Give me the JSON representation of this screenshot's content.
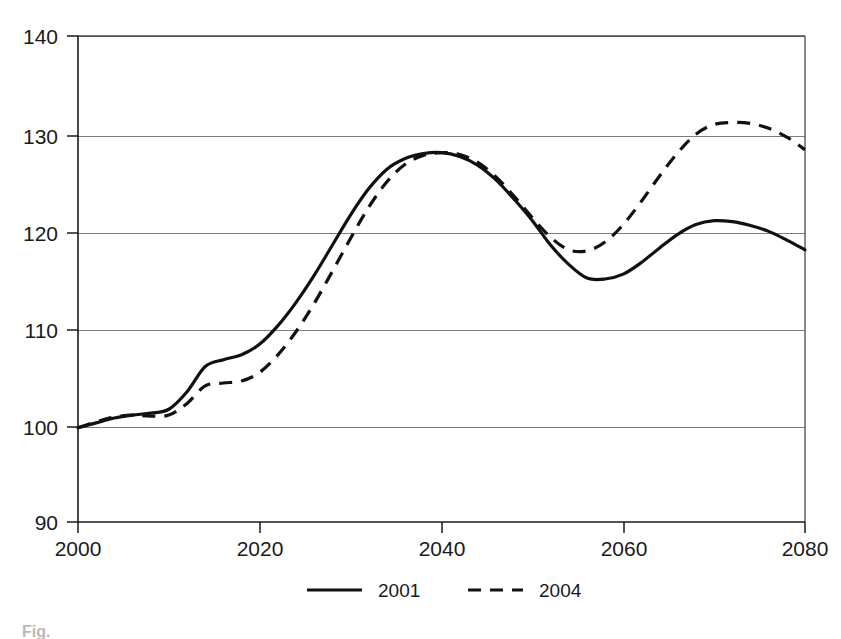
{
  "chart_data": {
    "type": "line",
    "title": "",
    "subtitle": "",
    "xlabel": "",
    "ylabel": "",
    "xlim": [
      2000,
      2080
    ],
    "ylim": [
      90,
      140
    ],
    "grid": true,
    "grid_axis": "y",
    "legend_position": "bottom-center",
    "x_ticks": [
      2000,
      2020,
      2040,
      2060,
      2080
    ],
    "x_tick_labels": [
      "2000",
      "2020",
      "2040",
      "2060",
      "2080"
    ],
    "y_ticks": [
      90,
      100,
      110,
      120,
      130,
      140
    ],
    "y_tick_labels": [
      "90",
      "100",
      "110",
      "120",
      "130",
      "140"
    ],
    "x": [
      2000,
      2002,
      2004,
      2006,
      2008,
      2010,
      2012,
      2014,
      2016,
      2018,
      2020,
      2022,
      2024,
      2026,
      2028,
      2030,
      2032,
      2034,
      2036,
      2038,
      2040,
      2042,
      2044,
      2046,
      2048,
      2050,
      2052,
      2054,
      2056,
      2058,
      2060,
      2062,
      2064,
      2066,
      2068,
      2070,
      2072,
      2074,
      2076,
      2078,
      2080
    ],
    "series": [
      {
        "name": "2001",
        "style": "solid",
        "values": [
          99.7,
          100.2,
          100.7,
          101.0,
          101.2,
          101.6,
          103.4,
          106.0,
          106.7,
          107.2,
          108.3,
          110.2,
          112.6,
          115.4,
          118.5,
          121.6,
          124.3,
          126.3,
          127.4,
          127.9,
          128.0,
          127.6,
          126.7,
          125.2,
          123.2,
          121.0,
          118.5,
          116.5,
          115.1,
          115.0,
          115.5,
          116.7,
          118.2,
          119.6,
          120.6,
          121.0,
          120.9,
          120.5,
          119.9,
          119.0,
          118.0
        ]
      },
      {
        "name": "2004",
        "style": "dashed",
        "values": [
          99.7,
          100.3,
          100.8,
          101.0,
          100.9,
          101.0,
          102.2,
          104.0,
          104.3,
          104.5,
          105.4,
          107.2,
          109.6,
          112.5,
          115.8,
          119.2,
          122.4,
          125.0,
          126.8,
          127.7,
          128.0,
          127.8,
          127.0,
          125.5,
          123.5,
          121.3,
          119.3,
          118.0,
          117.9,
          118.8,
          120.6,
          123.0,
          125.6,
          128.0,
          129.9,
          130.9,
          131.1,
          131.0,
          130.5,
          129.6,
          128.3
        ]
      }
    ],
    "annotations": []
  },
  "legend": {
    "entries": [
      {
        "label": "2001",
        "style": "solid"
      },
      {
        "label": "2004",
        "style": "dashed"
      }
    ]
  },
  "caption": {
    "text": "Fig."
  }
}
